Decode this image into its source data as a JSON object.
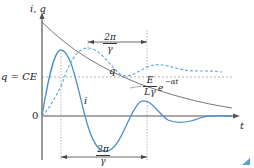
{
  "diagram": {
    "axes": {
      "y_label": "i, q",
      "x_label": "t",
      "origin_label": "0",
      "level_label": "q = CE"
    },
    "curves": {
      "q_label": "q",
      "i_label": "i",
      "envelope_label_num": "E",
      "envelope_label_den": "Lγ",
      "envelope_label_exp": "e",
      "envelope_label_sup": "−αt"
    },
    "periods": {
      "top_num": "2π",
      "top_den": "γ",
      "bottom_num": "2π",
      "bottom_den": "γ"
    },
    "colors": {
      "axis": "#555555",
      "envelope": "#777777",
      "current": "#4a8fd0",
      "charge": "#6aaee0",
      "guide": "#999999"
    }
  }
}
